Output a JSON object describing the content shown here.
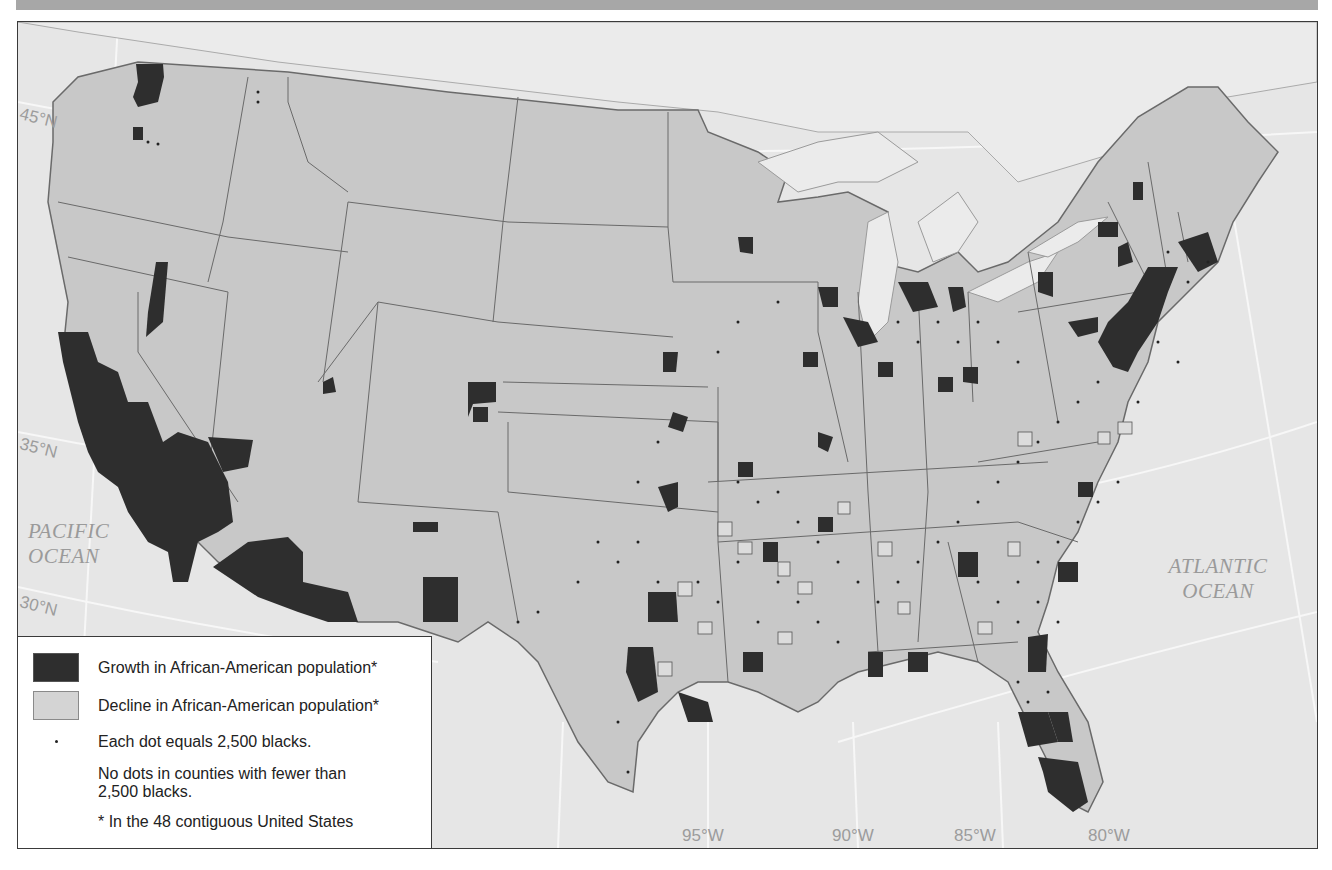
{
  "map": {
    "subject": "Change in African-American population by county, 48 contiguous United States",
    "colors": {
      "ocean": "#e6e6e6",
      "land": "#c8c8c8",
      "growth": "#2e2e2e",
      "decline": "#d4d4d4",
      "borders": "#555555",
      "graticule": "#f6f6f6",
      "banner": "#a7a7a7"
    },
    "latitude_labels": [
      "45°N",
      "35°N",
      "30°N"
    ],
    "longitude_labels": [
      "95°W",
      "90°W",
      "85°W",
      "80°W"
    ],
    "ocean_labels": {
      "pacific": [
        "PACIFIC",
        "OCEAN"
      ],
      "atlantic": [
        "ATLANTIC",
        "OCEAN"
      ]
    }
  },
  "legend": {
    "items": [
      {
        "symbol": "dark-swatch",
        "label": "Growth in African-American population*"
      },
      {
        "symbol": "light-swatch",
        "label": "Decline in African-American population*"
      },
      {
        "symbol": "dot",
        "label": "Each dot equals 2,500 blacks."
      },
      {
        "symbol": "none",
        "label": "No dots in counties with fewer than 2,500 blacks."
      },
      {
        "symbol": "none",
        "label": "* In the 48 contiguous United States"
      }
    ]
  }
}
